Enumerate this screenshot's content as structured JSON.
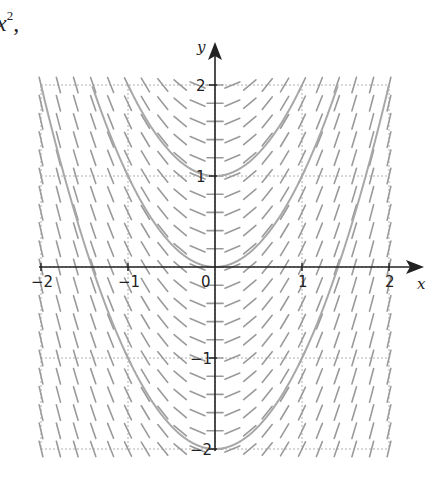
{
  "header_fragment": {
    "base": "x",
    "exponent": "2",
    "trailing": ","
  },
  "chart_data": {
    "type": "line",
    "title": "",
    "xlabel": "x",
    "ylabel": "y",
    "xlim": [
      -2,
      2
    ],
    "ylim": [
      -2,
      2
    ],
    "grid": true,
    "x_ticks": [
      "-2",
      "-1",
      "0",
      "1",
      "2"
    ],
    "y_ticks": [
      "2",
      "1",
      "-1",
      "-2"
    ],
    "slope_field": {
      "equation": "dy/dx = 2x",
      "spacing": 0.2
    },
    "series": [
      {
        "name": "y = x^2 + 1",
        "C": 1
      },
      {
        "name": "y = x^2",
        "C": 0
      },
      {
        "name": "y = x^2 - 2",
        "C": -2
      }
    ],
    "colors": {
      "curve": "#a8a8a8",
      "segment": "#9a9a9a",
      "grid": "#b0b0b0",
      "axis": "#222222"
    }
  }
}
